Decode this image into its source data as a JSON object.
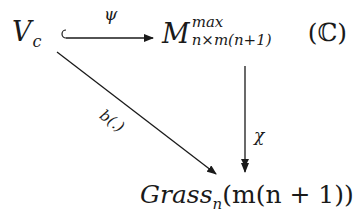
{
  "diagram": {
    "type": "commutative-diagram",
    "nodes": {
      "source": {
        "base": "V",
        "subscript": "c"
      },
      "target_top": {
        "base": "M",
        "superscript": "max",
        "subscript": "n×m(n+1)",
        "argument": "(ℂ)"
      },
      "target_bottom": {
        "base": "Grass",
        "subscript": "n",
        "argument": "(m(n + 1))"
      }
    },
    "arrows": [
      {
        "from": "source",
        "to": "target_top",
        "label": "ψ",
        "style": "hook-injection"
      },
      {
        "from": "target_top",
        "to": "target_bottom",
        "label": "χ",
        "style": "two-headed-surjection"
      },
      {
        "from": "source",
        "to": "target_bottom",
        "label": "b(.)",
        "style": "plain"
      }
    ]
  }
}
